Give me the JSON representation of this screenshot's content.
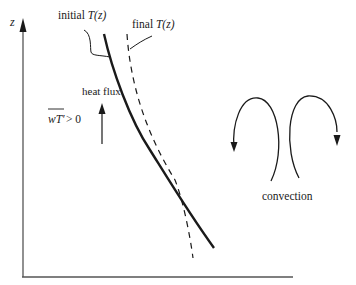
{
  "figure": {
    "axes": {
      "y_label": "z",
      "x_label": ""
    },
    "curves": [
      {
        "name": "initial",
        "label_prefix": "initial ",
        "label_func": "T(z)",
        "style": "solid"
      },
      {
        "name": "final",
        "label_prefix": "final ",
        "label_func": "T(z)",
        "style": "dashed"
      }
    ],
    "heat_flux": {
      "label": "heat flux",
      "condition_var": "wT′",
      "condition_rest": " > 0"
    },
    "convection": {
      "label": "convection"
    },
    "colors": {
      "ink": "#1a1a1a",
      "axis": "#555555",
      "background": "#ffffff"
    }
  }
}
